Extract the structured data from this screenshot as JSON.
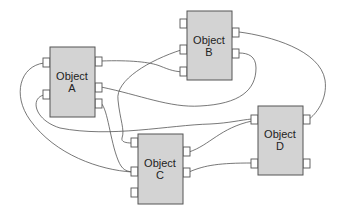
{
  "diagram": {
    "type": "object-connection-diagram",
    "objects": [
      {
        "id": "A",
        "line1": "Object",
        "line2": "A"
      },
      {
        "id": "B",
        "line1": "Object",
        "line2": "B"
      },
      {
        "id": "C",
        "line1": "Object",
        "line2": "C"
      },
      {
        "id": "D",
        "line1": "Object",
        "line2": "D"
      }
    ],
    "colors": {
      "box_fill": "#d3d3d3",
      "stroke": "#555555",
      "port_fill": "#ffffff"
    }
  }
}
